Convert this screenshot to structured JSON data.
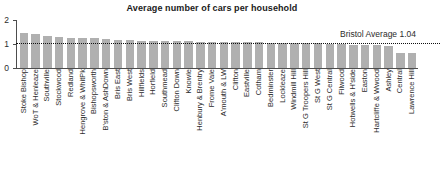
{
  "chart_data": {
    "type": "bar",
    "title": "Average number of cars per household",
    "xlabel": "",
    "ylabel": "",
    "ylim": [
      0,
      2
    ],
    "yticks": [
      0,
      1,
      2
    ],
    "ytick_labels": [
      "0",
      "1",
      "2"
    ],
    "grid": false,
    "legend": "none",
    "bar_color": "#b0b0b0",
    "annotations": [
      {
        "name": "bristol-average",
        "label": "Bristol Average 1.04",
        "value": 1.04,
        "style": "dotted-horizontal-line",
        "color": "#111111"
      }
    ],
    "categories": [
      "Stoke Bishop",
      "WoT & Henleaze",
      "Southville",
      "Stockwood",
      "Redland",
      "Hengrove & WhitPk",
      "Bishopsworth",
      "B'ston & AshDown",
      "Bris East",
      "Bris West",
      "Hillfields",
      "Horfield",
      "Southmead",
      "Clifton Down",
      "Knowle",
      "Henbury & Brentry",
      "Frome Vale",
      "A'mouth & LW",
      "Clifton",
      "Eastville",
      "Cotham",
      "Bedminster",
      "Lockleaze",
      "Windmill Hill",
      "St G Troopers Hill",
      "St G West",
      "St G Central",
      "Filwood",
      "Hotwells & H'side",
      "Easton",
      "Hartcliffe & Wwood",
      "Ashley",
      "Central",
      "Lawrence Hill"
    ],
    "values": [
      1.44,
      1.4,
      1.34,
      1.3,
      1.26,
      1.25,
      1.23,
      1.22,
      1.18,
      1.16,
      1.14,
      1.13,
      1.12,
      1.12,
      1.11,
      1.1,
      1.1,
      1.09,
      1.08,
      1.08,
      1.07,
      1.06,
      1.06,
      1.05,
      1.04,
      1.03,
      1.02,
      0.98,
      0.96,
      0.95,
      0.94,
      0.92,
      0.62,
      0.62
    ]
  }
}
